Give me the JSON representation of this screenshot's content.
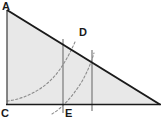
{
  "figure": {
    "kind": "geometry-diagram",
    "canvas": {
      "width": 167,
      "height": 123
    },
    "background_color": "#ffffff",
    "fill_color": "#e8e8e8",
    "stroke_color": "#1a1a1a",
    "dash_color": "#8c8c8c",
    "thin_line_color": "#6e6e6e",
    "labels": {
      "a": "A",
      "d": "D",
      "c": "C",
      "e": "E"
    },
    "points": {
      "A": {
        "x": 7,
        "y": 10
      },
      "C": {
        "x": 7,
        "y": 104
      },
      "B": {
        "x": 160,
        "y": 105
      },
      "D": {
        "x": 84,
        "y": 51
      },
      "E": {
        "x": 63,
        "y": 104
      }
    },
    "triangle": {
      "name": "ACB",
      "vertices": "7,10 7,104 160,105"
    },
    "vertical_segments": [
      {
        "name": "segment-at-E",
        "x": 63,
        "y1": 39,
        "y2": 113
      },
      {
        "name": "segment-at-D",
        "x": 92,
        "y1": 50,
        "y2": 111
      }
    ],
    "dashed_curves": [
      {
        "name": "curve-1",
        "path": "M 7 101 C 26 99 46 88 58 72 C 66 61 71 51 75 42"
      },
      {
        "name": "curve-2",
        "path": "M 52 114 C 62 108 72 97 81 83 C 87 73 91 63 94 53"
      }
    ]
  }
}
